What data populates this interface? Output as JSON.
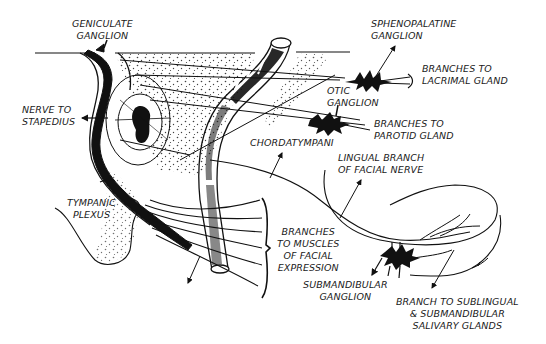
{
  "diagram": {
    "colors": {
      "ink": "#111111",
      "background": "#ffffff"
    },
    "labels": {
      "geniculate_ganglion": [
        "GENICULATE",
        "GANGLION"
      ],
      "sphenopalatine_ganglion": [
        "SPHENOPALATINE",
        "GANGLION"
      ],
      "branches_lacrimal": [
        "BRANCHES TO",
        "LACRIMAL GLAND"
      ],
      "nerve_to_stapedius": [
        "NERVE TO",
        "STAPEDIUS"
      ],
      "otic_ganglion": [
        "OTIC",
        "GANGLION"
      ],
      "branches_parotid": [
        "BRANCHES TO",
        "PAROTID GLAND"
      ],
      "chordatympani": [
        "CHORDATYMPANI"
      ],
      "lingual_branch": [
        "LINGUAL BRANCH",
        "OF FACIAL NERVE"
      ],
      "tympanic_plexus": [
        "TYMPANIC",
        "PLEXUS"
      ],
      "branches_facial_expression": [
        "BRANCHES",
        "TO MUSCLES",
        "OF FACIAL",
        "EXPRESSION"
      ],
      "submandibular_ganglion": [
        "SUBMANDIBULAR",
        "GANGLION"
      ],
      "branch_sublingual": [
        "BRANCH TO SUBLINGUAL",
        "&  SUBMANDIBULAR",
        "SALIVARY GLANDS"
      ]
    }
  }
}
